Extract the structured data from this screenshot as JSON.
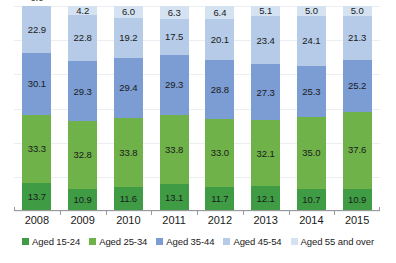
{
  "chart_data": {
    "type": "bar",
    "stacked": true,
    "stack_mode": "percent",
    "title": "",
    "subtitle": "",
    "xlabel": "",
    "ylabel": "",
    "ylim": [
      0,
      100
    ],
    "grid": true,
    "gridline_count": 6,
    "legend_position": "bottom",
    "categories": [
      "2008",
      "2009",
      "2010",
      "2011",
      "2012",
      "2013",
      "2014",
      "2015"
    ],
    "series": [
      {
        "name": "Aged 15-24",
        "color": "#3f9c45",
        "values": [
          13.7,
          10.9,
          11.6,
          13.1,
          11.7,
          12.1,
          10.7,
          10.9
        ],
        "labels": [
          "13.7",
          "10.9",
          "11.6",
          "13.1",
          "11.7",
          "12.1",
          "10.7",
          "10.9"
        ]
      },
      {
        "name": "Aged 25-34",
        "color": "#6fb24a",
        "values": [
          33.3,
          32.8,
          33.8,
          33.8,
          33.0,
          32.1,
          35.0,
          37.6
        ],
        "labels": [
          "33.3",
          "32.8",
          "33.8",
          "33.8",
          "33.0",
          "32.1",
          "35.0",
          "37.6"
        ]
      },
      {
        "name": "Aged 35-44",
        "color": "#7b9dd4",
        "values": [
          30.1,
          29.3,
          29.4,
          29.3,
          28.8,
          27.3,
          25.3,
          25.2
        ],
        "labels": [
          "30.1",
          "29.3",
          "29.4",
          "29.3",
          "28.8",
          "27.3",
          "25.3",
          "25.2"
        ]
      },
      {
        "name": "Aged 45-54",
        "color": "#b5cbe7",
        "values": [
          22.9,
          22.8,
          19.2,
          17.5,
          20.1,
          23.4,
          24.1,
          21.3
        ],
        "labels": [
          "22.9",
          "22.8",
          "19.2",
          "17.5",
          "20.1",
          "23.4",
          "24.1",
          "21.3"
        ]
      },
      {
        "name": "Aged 55 and over",
        "color": "#d4e2f2",
        "values": [
          0.0,
          4.2,
          6.0,
          6.3,
          6.4,
          5.1,
          5.0,
          5.0
        ],
        "labels": [
          "0.0",
          "4.2",
          "6.0",
          "6.3",
          "6.4",
          "5.1",
          "5.0",
          "5.0"
        ]
      }
    ]
  },
  "legend": {
    "items": [
      {
        "label": "Aged 15-24",
        "color": "#3f9c45"
      },
      {
        "label": "Aged 25-34",
        "color": "#6fb24a"
      },
      {
        "label": "Aged 35-44",
        "color": "#7b9dd4"
      },
      {
        "label": "Aged 45-54",
        "color": "#b5cbe7"
      },
      {
        "label": "Aged 55 and over",
        "color": "#d4e2f2"
      }
    ]
  },
  "axis": {
    "grid_color": "#ebeff3",
    "axis_color": "#9a9a9a"
  }
}
